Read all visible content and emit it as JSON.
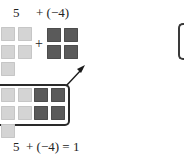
{
  "top_equation": {
    "lhs": "5",
    "rhs": "+ (−4)"
  },
  "bottom_equation": {
    "text": "5  + (−4) = 1"
  },
  "plus_sign": "+",
  "tiles": {
    "positive_count": 5,
    "negative_count": 4,
    "zero_pairs": 4,
    "remaining_positive": 1
  },
  "colors": {
    "positive_tile": "#d4d4d4",
    "negative_tile": "#5a5a5a",
    "outline": "#2a2a2a"
  }
}
